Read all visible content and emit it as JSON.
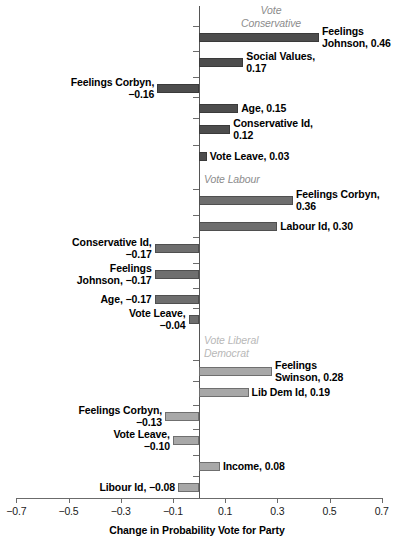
{
  "chart_data": {
    "type": "bar",
    "orientation": "horizontal",
    "title": "",
    "xlabel": "Change in Probability Vote for Party",
    "ylabel": "",
    "xlim": [
      -0.7,
      0.7
    ],
    "xticks": [
      -0.7,
      -0.5,
      -0.3,
      -0.1,
      0.1,
      0.3,
      0.5,
      0.7
    ],
    "xtick_labels": [
      "−0.7",
      "−0.5",
      "−0.3",
      "−0.1",
      "0.1",
      "0.3",
      "0.5",
      "0.7"
    ],
    "grid": false,
    "legend": "none",
    "groups": [
      {
        "name": "Vote Conservative",
        "header_label": "Vote\nConservative",
        "header_color": "#8c8c8c",
        "bar_color": "#4d4d4d",
        "bars": [
          {
            "label": "Feelings\nJohnson, 0.46",
            "variable": "Feelings Johnson",
            "value": 0.46
          },
          {
            "label": "Social Values,\n0.17",
            "variable": "Social Values",
            "value": 0.17
          },
          {
            "label": "Feelings Corbyn,\n−0.16",
            "variable": "Feelings Corbyn",
            "value": -0.16
          },
          {
            "label": "Age, 0.15",
            "variable": "Age",
            "value": 0.15
          },
          {
            "label": "Conservative Id,\n0.12",
            "variable": "Conservative Id",
            "value": 0.12
          },
          {
            "label": "Vote Leave, 0.03",
            "variable": "Vote Leave",
            "value": 0.03
          }
        ]
      },
      {
        "name": "Vote Labour",
        "header_label": "Vote Labour",
        "header_color": "#8c8c8c",
        "bar_color": "#6e6e6e",
        "bars": [
          {
            "label": "Feelings Corbyn,\n0.36",
            "variable": "Feelings Corbyn",
            "value": 0.36
          },
          {
            "label": "Labour Id, 0.30",
            "variable": "Labour Id",
            "value": 0.3
          },
          {
            "label": "Conservative Id,\n−0.17",
            "variable": "Conservative Id",
            "value": -0.17
          },
          {
            "label": "Feelings\nJohnson, −0.17",
            "variable": "Feelings Johnson",
            "value": -0.17
          },
          {
            "label": "Age, −0.17",
            "variable": "Age",
            "value": -0.17
          },
          {
            "label": "Vote Leave,\n−0.04",
            "variable": "Vote Leave",
            "value": -0.04
          }
        ]
      },
      {
        "name": "Vote Liberal Democrat",
        "header_label": "Vote Liberal\nDemocrat",
        "header_color": "#b8b8b8",
        "bar_color": "#a8a8a8",
        "bars": [
          {
            "label": "Feelings\nSwinson, 0.28",
            "variable": "Feelings Swinson",
            "value": 0.28
          },
          {
            "label": "Lib Dem Id, 0.19",
            "variable": "Lib Dem Id",
            "value": 0.19
          },
          {
            "label": "Feelings Corbyn,\n−0.13",
            "variable": "Feelings Corbyn",
            "value": -0.13
          },
          {
            "label": "Vote Leave,\n−0.10",
            "variable": "Vote Leave",
            "value": -0.1
          },
          {
            "label": "Income, 0.08",
            "variable": "Income",
            "value": 0.08
          },
          {
            "label": "Libour Id, −0.08",
            "variable": "Libour Id",
            "value": -0.08
          }
        ]
      }
    ]
  }
}
